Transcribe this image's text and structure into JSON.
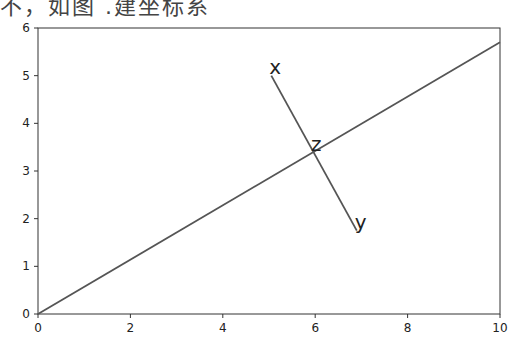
{
  "caption": "不，如图 .建坐标系",
  "chart_data": {
    "type": "line",
    "title": "",
    "xlabel": "",
    "ylabel": "",
    "xlim": [
      0,
      10
    ],
    "ylim": [
      0,
      6
    ],
    "x_ticks": [
      "0",
      "2",
      "4",
      "6",
      "8",
      "10"
    ],
    "y_ticks": [
      "0",
      "1",
      "2",
      "3",
      "4",
      "5",
      "6"
    ],
    "grid": false,
    "series": [
      {
        "name": "main-line",
        "x": [
          0,
          10
        ],
        "y": [
          0,
          5.7
        ]
      },
      {
        "name": "segment-xy",
        "x": [
          5.05,
          6.9
        ],
        "y": [
          5.0,
          1.75
        ]
      }
    ],
    "annotations": [
      {
        "text": "x",
        "x": 5.05,
        "y": 5.0
      },
      {
        "text": "z",
        "x": 5.95,
        "y": 3.38
      },
      {
        "text": "y",
        "x": 6.9,
        "y": 1.75
      }
    ]
  }
}
